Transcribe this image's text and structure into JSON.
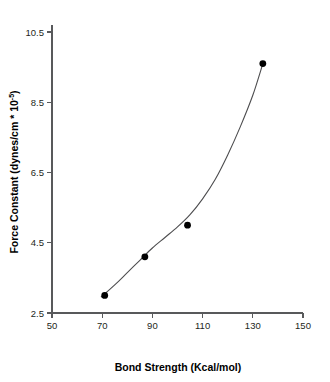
{
  "chart_data": {
    "type": "scatter",
    "title": "",
    "xlabel": "Bond Strength (Kcal/mol)",
    "ylabel": "Force Constant (dynes/cm * 10",
    "ylabel_superscript": "-5",
    "ylabel_suffix": ")",
    "xlim": [
      50,
      150
    ],
    "ylim": [
      2.5,
      10.5
    ],
    "xticks": [
      50,
      70,
      90,
      110,
      130,
      150
    ],
    "yticks": [
      2.5,
      4.5,
      6.5,
      8.5,
      10.5
    ],
    "xtick_labels": [
      "50",
      "70",
      "90",
      "110",
      "130",
      "150"
    ],
    "ytick_labels": [
      "2.5",
      "4.5",
      "6.5",
      "8.5",
      "10.5"
    ],
    "grid": false,
    "legend": "none",
    "x": [
      71,
      87,
      104,
      134
    ],
    "values": [
      3.0,
      4.1,
      5.0,
      9.6
    ],
    "series": [
      {
        "name": "Force constant vs bond strength",
        "points": [
          {
            "x": 71,
            "y": 3.0
          },
          {
            "x": 87,
            "y": 4.1
          },
          {
            "x": 104,
            "y": 5.0
          },
          {
            "x": 134,
            "y": 9.6
          }
        ]
      }
    ],
    "fit_curve": {
      "description": "smooth increasing curve through the four points",
      "points": [
        {
          "x": 69.5,
          "y": 2.95
        },
        {
          "x": 75,
          "y": 3.3
        },
        {
          "x": 80,
          "y": 3.65
        },
        {
          "x": 85,
          "y": 4.0
        },
        {
          "x": 90,
          "y": 4.35
        },
        {
          "x": 95,
          "y": 4.65
        },
        {
          "x": 100,
          "y": 4.95
        },
        {
          "x": 105,
          "y": 5.3
        },
        {
          "x": 110,
          "y": 5.75
        },
        {
          "x": 115,
          "y": 6.3
        },
        {
          "x": 120,
          "y": 7.0
        },
        {
          "x": 125,
          "y": 7.8
        },
        {
          "x": 130,
          "y": 8.7
        },
        {
          "x": 134,
          "y": 9.6
        }
      ]
    },
    "colors": {
      "marker": "#000000",
      "curve": "#4d4d4f",
      "axis": "#58595b",
      "background": "#ffffff",
      "text": "#000000"
    }
  }
}
